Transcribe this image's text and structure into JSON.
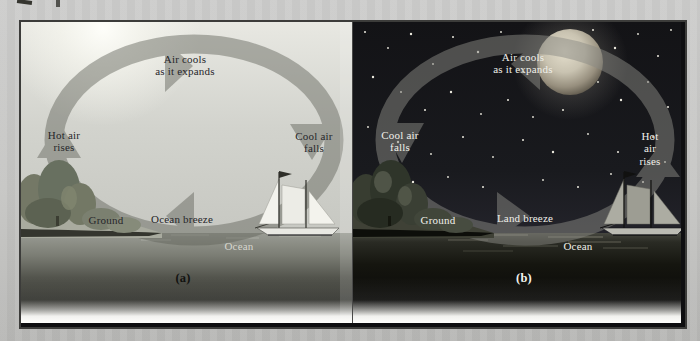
{
  "panels": [
    {
      "caption": "(a)",
      "time_of_day": "day",
      "labels": {
        "top": "Air cools\nas it expands",
        "left": "Hot air\nrises",
        "right": "Cool air\nfalls",
        "ground": "Ground",
        "surface_wind": "Ocean breeze",
        "water": "Ocean"
      }
    },
    {
      "caption": "(b)",
      "time_of_day": "night",
      "labels": {
        "top": "Air cools\nas it expands",
        "left": "Cool air\nfalls",
        "right": "Hot air\nrises",
        "ground": "Ground",
        "surface_wind": "Land breeze",
        "water": "Ocean"
      }
    }
  ],
  "scene": {
    "panel_a": [
      "sun-glow",
      "shoreline-trees",
      "sailboat",
      "circulation-arrows"
    ],
    "panel_b": [
      "moon",
      "stars",
      "shoreline-trees",
      "sailboat",
      "circulation-arrows"
    ]
  },
  "colors": {
    "page_background": "#c3c3c1",
    "day_sky": "#d2d3cd",
    "night_sky": "#17171a",
    "arrow_band_day": "#9e9e9a",
    "arrow_band_night": "#505050",
    "label_day": "#26262a",
    "label_night": "#f0f0ea",
    "frame_border": "#3c3c3a"
  }
}
